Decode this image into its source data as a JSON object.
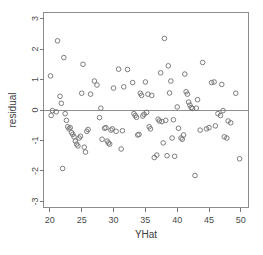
{
  "chart_data": {
    "type": "scatter",
    "title": "",
    "xlabel": "YHat",
    "ylabel": "residual",
    "xlim": [
      19.0,
      51.2
    ],
    "ylim": [
      -3.2,
      3.2
    ],
    "xticks": [
      20,
      25,
      30,
      35,
      40,
      45,
      50
    ],
    "xticklabels": [
      "20",
      "25",
      "30",
      "35",
      "40",
      "45",
      "50"
    ],
    "yticks": [
      -3,
      -2,
      -1,
      0,
      1,
      2,
      3
    ],
    "yticklabels": [
      "-3",
      "-2",
      "-1",
      "0",
      "1",
      "2",
      "3"
    ],
    "grid": false,
    "legend": null,
    "marker": "open-circle",
    "marker_color": "#6f6f6f",
    "reference_lines": [
      {
        "orientation": "horizontal",
        "value": 0,
        "color": "#8f8f8f"
      }
    ],
    "annotations": [],
    "n_points": 112,
    "x": [
      20.1,
      20.2,
      20.4,
      21.0,
      21.2,
      21.6,
      21.8,
      22.0,
      22.2,
      22.4,
      22.6,
      22.8,
      23.0,
      23.2,
      23.4,
      23.6,
      23.8,
      24.0,
      24.2,
      24.4,
      24.6,
      24.8,
      25.0,
      25.2,
      25.4,
      25.6,
      25.8,
      26.0,
      26.4,
      27.0,
      27.4,
      27.8,
      28.0,
      28.2,
      28.6,
      28.8,
      29.0,
      29.2,
      29.4,
      29.6,
      29.8,
      30.0,
      30.4,
      30.8,
      31.2,
      31.4,
      31.6,
      32.2,
      33.0,
      33.2,
      33.4,
      33.6,
      33.8,
      34.0,
      34.2,
      34.4,
      34.6,
      34.8,
      35.0,
      35.2,
      35.4,
      35.6,
      35.8,
      36.0,
      36.4,
      36.8,
      37.0,
      37.2,
      37.4,
      37.6,
      37.8,
      38.0,
      38.2,
      38.4,
      38.6,
      38.8,
      39.0,
      39.2,
      39.4,
      39.6,
      40.0,
      40.2,
      40.6,
      40.8,
      41.0,
      41.2,
      41.4,
      41.6,
      41.8,
      42.0,
      42.2,
      42.4,
      42.8,
      43.0,
      43.2,
      43.6,
      44.0,
      44.6,
      45.0,
      45.4,
      45.8,
      46.0,
      46.4,
      46.8,
      47.0,
      47.2,
      47.4,
      47.8,
      48.0,
      48.4,
      49.2,
      49.8
    ],
    "y": [
      1.12,
      -0.18,
      -0.02,
      -0.06,
      2.27,
      0.45,
      0.22,
      -1.92,
      1.72,
      -0.12,
      -0.34,
      -0.55,
      -0.62,
      -0.58,
      -0.74,
      -0.8,
      -0.88,
      -1.02,
      -1.12,
      -1.18,
      -0.92,
      -0.86,
      0.55,
      1.5,
      -1.22,
      -1.38,
      -0.7,
      -0.64,
      0.52,
      0.95,
      0.82,
      -0.25,
      0.06,
      -0.96,
      -0.6,
      -0.58,
      -1.02,
      -1.08,
      -1.12,
      -0.66,
      -0.62,
      0.72,
      -0.7,
      1.34,
      -1.28,
      -0.68,
      0.76,
      1.33,
      0.9,
      -0.12,
      -0.18,
      -0.24,
      -0.82,
      -0.8,
      0.55,
      0.48,
      -0.2,
      -0.14,
      0.92,
      -0.08,
      0.52,
      -0.55,
      -0.62,
      0.48,
      -1.56,
      -1.48,
      -0.3,
      -0.36,
      1.22,
      -0.38,
      -1.08,
      2.35,
      -0.34,
      -1.5,
      1.45,
      0.56,
      0.95,
      -0.92,
      -0.32,
      -1.52,
      0.1,
      -0.6,
      -0.92,
      -0.96,
      -0.82,
      1.18,
      0.6,
      0.52,
      0.26,
      0.16,
      0.08,
      0.05,
      -2.15,
      0.06,
      0.34,
      -0.66,
      1.56,
      -0.62,
      -0.58,
      0.9,
      0.92,
      -0.52,
      -0.12,
      -0.18,
      0.84,
      -0.02,
      -0.88,
      -0.92,
      -0.36,
      -0.42,
      0.55,
      -1.6
    ]
  },
  "axis": {
    "x_title": "YHat",
    "y_title": "residual"
  }
}
